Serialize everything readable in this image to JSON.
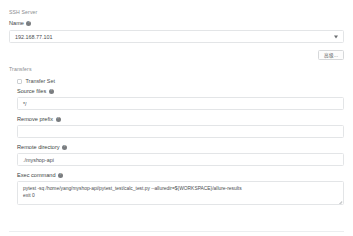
{
  "form": {
    "ssh_server": {
      "section_label": "SSH Server",
      "name_label": "Name",
      "name_value": "192.168.77.101",
      "help_icon": "help-icon",
      "chevron_icon": "chevron-down-icon",
      "advanced_button": "高级..."
    },
    "transfers": {
      "section_label": "Transfers",
      "transfer_set_label": "Transfer Set",
      "checkbox_icon": "checkbox-unchecked-icon",
      "source_files": {
        "label": "Source files",
        "value": "*/"
      },
      "remove_prefix": {
        "label": "Remove prefix",
        "value": ""
      },
      "remote_directory": {
        "label": "Remote directory",
        "value": "./myshop-api"
      },
      "exec_command": {
        "label": "Exec command",
        "line1": "pytest -sq /home/yang/myshop-api/pytest_test/calc_test.py --alluredir=${WORKSPACE}/allure-results",
        "line2": "exit 0",
        "resize_icon": "resize-grip-icon"
      }
    }
  },
  "colors": {
    "border": "#e3e5e7",
    "text": "#4a4d50",
    "muted": "#8a8d90",
    "background": "#ffffff"
  }
}
